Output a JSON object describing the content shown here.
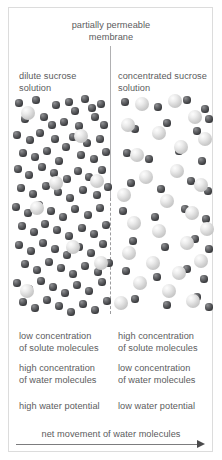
{
  "figure": {
    "title": "partially permeable\nmembrane",
    "left_panel": {
      "solution_label": "dilute sucrose\nsolution",
      "solute_concentration": "low concentration\nof solute molecules",
      "water_concentration": "high concentration\nof water molecules",
      "water_potential": "high water potential"
    },
    "right_panel": {
      "solution_label": "concentrated sucrose\nsolution",
      "solute_concentration": "high concentration\nof solute molecules",
      "water_concentration": "low concentration\nof water molecules",
      "water_potential": "low water potential"
    },
    "net_movement_caption": "net movement of water molecules",
    "colors": {
      "text": "#5b5b5d",
      "frame": "#dcdcdc",
      "membrane": "#a9a9ab",
      "arrow": "#7c7c7e",
      "water_molecule": "#3c3d40",
      "solute_molecule": "#cfcfcf"
    }
  },
  "chart_data": {
    "type": "scatter",
    "title": "partially permeable membrane",
    "xlabel": "",
    "ylabel": "",
    "legend": [
      {
        "name": "water molecule",
        "color": "#3c3d40",
        "size_px": 7
      },
      {
        "name": "sucrose (solute) molecule",
        "color": "#cfcfcf",
        "size_px": 14
      }
    ],
    "annotations": [
      "dilute sucrose solution",
      "concentrated sucrose solution",
      "net movement of water molecules"
    ],
    "series": [
      {
        "name": "left-water",
        "kind": "water",
        "side": "left",
        "r": 3.6,
        "points": [
          [
            10,
            8
          ],
          [
            27,
            5
          ],
          [
            47,
            10
          ],
          [
            60,
            7
          ],
          [
            66,
            16
          ],
          [
            76,
            4
          ],
          [
            83,
            13
          ],
          [
            92,
            9
          ],
          [
            16,
            24
          ],
          [
            35,
            22
          ],
          [
            43,
            30
          ],
          [
            55,
            27
          ],
          [
            70,
            31
          ],
          [
            86,
            22
          ],
          [
            95,
            30
          ],
          [
            8,
            40
          ],
          [
            21,
            45
          ],
          [
            31,
            38
          ],
          [
            46,
            44
          ],
          [
            57,
            52
          ],
          [
            64,
            42
          ],
          [
            78,
            48
          ],
          [
            91,
            44
          ],
          [
            14,
            58
          ],
          [
            26,
            62
          ],
          [
            38,
            56
          ],
          [
            50,
            66
          ],
          [
            72,
            60
          ],
          [
            85,
            64
          ],
          [
            97,
            57
          ],
          [
            9,
            74
          ],
          [
            20,
            80
          ],
          [
            33,
            72
          ],
          [
            45,
            78
          ],
          [
            58,
            84
          ],
          [
            69,
            76
          ],
          [
            80,
            82
          ],
          [
            93,
            75
          ],
          [
            12,
            93
          ],
          [
            24,
            99
          ],
          [
            37,
            91
          ],
          [
            49,
            97
          ],
          [
            61,
            103
          ],
          [
            74,
            95
          ],
          [
            88,
            100
          ],
          [
            99,
            92
          ],
          [
            7,
            112
          ],
          [
            19,
            118
          ],
          [
            30,
            110
          ],
          [
            42,
            116
          ],
          [
            54,
            122
          ],
          [
            66,
            114
          ],
          [
            79,
            120
          ],
          [
            91,
            113
          ],
          [
            13,
            131
          ],
          [
            25,
            137
          ],
          [
            36,
            129
          ],
          [
            48,
            135
          ],
          [
            60,
            141
          ],
          [
            73,
            133
          ],
          [
            85,
            139
          ],
          [
            97,
            130
          ],
          [
            10,
            150
          ],
          [
            22,
            156
          ],
          [
            34,
            148
          ],
          [
            46,
            154
          ],
          [
            58,
            160
          ],
          [
            70,
            152
          ],
          [
            82,
            158
          ],
          [
            94,
            149
          ],
          [
            16,
            169
          ],
          [
            28,
            175
          ],
          [
            40,
            167
          ],
          [
            52,
            173
          ],
          [
            64,
            179
          ],
          [
            76,
            171
          ],
          [
            89,
            177
          ],
          [
            100,
            168
          ],
          [
            8,
            188
          ],
          [
            20,
            194
          ],
          [
            32,
            186
          ],
          [
            44,
            192
          ],
          [
            56,
            198
          ],
          [
            68,
            190
          ],
          [
            80,
            196
          ],
          [
            93,
            187
          ],
          [
            14,
            207
          ],
          [
            26,
            213
          ],
          [
            38,
            205
          ],
          [
            50,
            211
          ],
          [
            62,
            217
          ],
          [
            74,
            209
          ],
          [
            86,
            215
          ],
          [
            98,
            206
          ]
        ]
      },
      {
        "name": "left-sucrose",
        "kind": "sucrose",
        "side": "left",
        "r": 7.2,
        "points": [
          [
            19,
            18
          ],
          [
            72,
            41
          ],
          [
            88,
            86
          ],
          [
            28,
            113
          ],
          [
            64,
            152
          ],
          [
            18,
            196
          ],
          [
            92,
            168
          ],
          [
            47,
            88
          ]
        ]
      },
      {
        "name": "right-water",
        "kind": "water",
        "side": "right",
        "r": 3.6,
        "points": [
          [
            116,
            7
          ],
          [
            149,
            12
          ],
          [
            178,
            5
          ],
          [
            196,
            14
          ],
          [
            126,
            34
          ],
          [
            158,
            28
          ],
          [
            188,
            36
          ],
          [
            200,
            24
          ],
          [
            118,
            58
          ],
          [
            140,
            64
          ],
          [
            170,
            56
          ],
          [
            193,
            66
          ],
          [
            122,
            88
          ],
          [
            152,
            94
          ],
          [
            182,
            86
          ],
          [
            199,
            96
          ],
          [
            114,
            116
          ],
          [
            146,
            122
          ],
          [
            176,
            114
          ],
          [
            197,
            124
          ],
          [
            124,
            146
          ],
          [
            156,
            152
          ],
          [
            186,
            144
          ],
          [
            200,
            154
          ],
          [
            117,
            176
          ],
          [
            148,
            182
          ],
          [
            178,
            174
          ],
          [
            195,
            184
          ],
          [
            126,
            204
          ],
          [
            158,
            210
          ],
          [
            188,
            202
          ],
          [
            200,
            212
          ]
        ]
      },
      {
        "name": "right-sucrose",
        "kind": "sucrose",
        "side": "right",
        "r": 7.2,
        "points": [
          [
            133,
            9
          ],
          [
            166,
            6
          ],
          [
            119,
            30
          ],
          [
            186,
            22
          ],
          [
            150,
            38
          ],
          [
            128,
            60
          ],
          [
            172,
            52
          ],
          [
            196,
            44
          ],
          [
            137,
            82
          ],
          [
            168,
            76
          ],
          [
            192,
            90
          ],
          [
            115,
            100
          ],
          [
            158,
            106
          ],
          [
            183,
            118
          ],
          [
            125,
            128
          ],
          [
            150,
            136
          ],
          [
            178,
            148
          ],
          [
            198,
            134
          ],
          [
            120,
            158
          ],
          [
            144,
            168
          ],
          [
            170,
            178
          ],
          [
            192,
            166
          ],
          [
            131,
            188
          ],
          [
            160,
            196
          ],
          [
            184,
            206
          ],
          [
            112,
            208
          ]
        ]
      }
    ]
  }
}
